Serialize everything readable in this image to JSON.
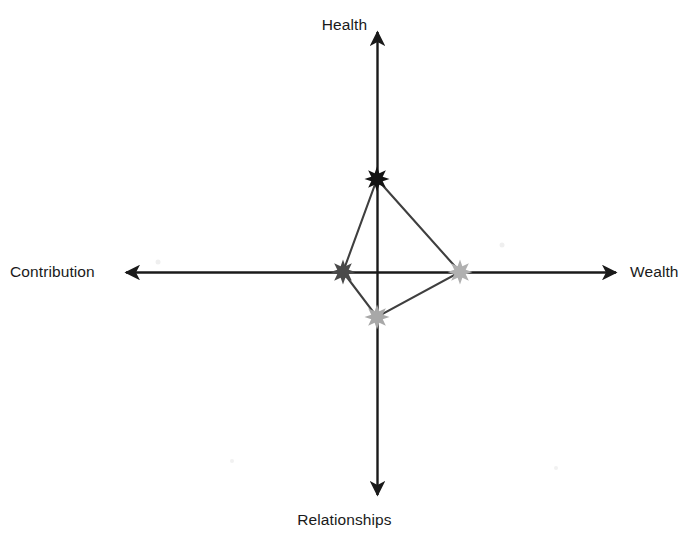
{
  "chart_data": {
    "type": "radar",
    "title": "",
    "axes": [
      {
        "key": "health",
        "label": "Health",
        "direction": "up",
        "value": 93
      },
      {
        "key": "wealth",
        "label": "Wealth",
        "direction": "right",
        "value": 83
      },
      {
        "key": "relationships",
        "label": "Relationships",
        "direction": "down",
        "value": 45
      },
      {
        "key": "contribution",
        "label": "Contribution",
        "direction": "left",
        "value": 34
      }
    ],
    "categories": [
      "Health",
      "Wealth",
      "Relationships",
      "Contribution"
    ],
    "values": [
      93,
      83,
      45,
      34
    ],
    "marker_colors": [
      "#141414",
      "#b0b0b0",
      "#a8a8a8",
      "#4a4a4a"
    ],
    "marker_shape": "eight-point-star",
    "series_line_color": "#3f3f3f",
    "axis_color": "#1a1a1a",
    "grid": false,
    "legend": false,
    "xlabel": "",
    "ylabel": "",
    "origin": {
      "x": 377,
      "y": 272
    },
    "axis_extents": {
      "up": 30,
      "down": 497,
      "left": 124,
      "right": 618
    }
  },
  "labels": {
    "health": "Health",
    "wealth": "Wealth",
    "relationships": "Relationships",
    "contribution": "Contribution"
  }
}
